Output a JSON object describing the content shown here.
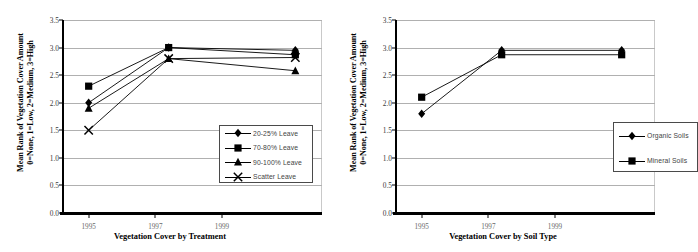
{
  "figure": {
    "background": "#ffffff",
    "marker_color": "#000000",
    "line_color": "#000000",
    "gridline_color": "#b0b0b0"
  },
  "chart_data": [
    {
      "id": "treatment",
      "type": "line",
      "title": "",
      "xlabel": "Vegetation Cover by Treatment",
      "ylabel": "Mean Rank of Vegetation Cover Amount 0=None, 1=Low, 2=Medium, 3=High",
      "ylabel_line1": "Mean Rank of Vegetation Cover Amount",
      "ylabel_line2": "0=None, 1=Low, 2=Medium, 3=High",
      "ylim": [
        0.0,
        3.5
      ],
      "yticks": [
        "0.0",
        "0.5",
        "1.0",
        "1.5",
        "2.0",
        "2.5",
        "3.0",
        "3.5"
      ],
      "ytick_values": [
        0.0,
        0.5,
        1.0,
        1.5,
        2.0,
        2.5,
        3.0,
        3.5
      ],
      "xlim": [
        1994.2,
        2002.0
      ],
      "xticks": [
        "1995",
        "1997",
        "1999"
      ],
      "xtick_values": [
        1995,
        1997,
        1999
      ],
      "x": [
        1995,
        1997.4,
        2001.2
      ],
      "grid": true,
      "legend_position": "bottom-right",
      "series": [
        {
          "name": "20-25% Leave",
          "marker": "diamond",
          "values": [
            2.0,
            3.0,
            2.95
          ]
        },
        {
          "name": "70-80% Leave",
          "marker": "square",
          "values": [
            2.3,
            3.0,
            2.87
          ]
        },
        {
          "name": "90-100% Leave",
          "marker": "triangle",
          "values": [
            1.9,
            2.8,
            2.58
          ]
        },
        {
          "name": "Scatter Leave",
          "marker": "cross",
          "values": [
            1.5,
            2.8,
            2.82
          ]
        }
      ]
    },
    {
      "id": "soil",
      "type": "line",
      "title": "",
      "xlabel": "Vegetation Cover by Soil Type",
      "ylabel": "Mean Rank of Vegetation Cover Amount 0=None, 1=Low, 2=Medium, 3=High",
      "ylabel_line1": "Mean Rank of Vegetation Cover Amount",
      "ylabel_line2": "0=None, 1=Low, 2=Medium, 3=High",
      "ylim": [
        0.0,
        3.5
      ],
      "yticks": [
        "0.0",
        "0.5",
        "1.0",
        "1.5",
        "2.0",
        "2.5",
        "3.0",
        "3.5"
      ],
      "ytick_values": [
        0.0,
        0.5,
        1.0,
        1.5,
        2.0,
        2.5,
        3.0,
        3.5
      ],
      "xlim": [
        1994.2,
        2002.0
      ],
      "xticks": [
        "1995",
        "1997",
        "1999"
      ],
      "xtick_values": [
        1995,
        1997,
        1999
      ],
      "x": [
        1995,
        1997.4,
        2001.0
      ],
      "grid": true,
      "legend_position": "bottom-right",
      "series": [
        {
          "name": "Organic Soils",
          "marker": "diamond",
          "values": [
            1.8,
            2.95,
            2.95
          ]
        },
        {
          "name": "Mineral Soils",
          "marker": "square",
          "values": [
            2.1,
            2.87,
            2.87
          ]
        }
      ]
    }
  ]
}
